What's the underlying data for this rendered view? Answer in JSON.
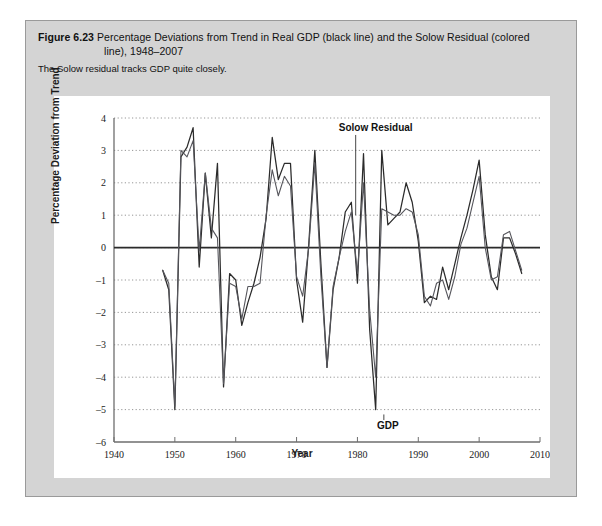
{
  "figure": {
    "label": "Figure 6.23",
    "title_line1": "Percentage Deviations from Trend in Real GDP (black line) and the Solow Residual (colored",
    "title_line2": "line), 1948–2007",
    "subtitle": "The Solow residual tracks GDP quite closely."
  },
  "colors": {
    "panel_background": "#d4d4d4",
    "panel_border": "#9a9a9a",
    "chart_background": "#ffffff",
    "gdp_line": "#2b2b2b",
    "solow_line": "#56565c",
    "grid": "#8a8a8a",
    "axis": "#6e6e6e",
    "zero_line": "#2b2b2b"
  },
  "chart_data": {
    "type": "line",
    "title": "Percentage Deviations from Trend in Real GDP (black line) and the Solow Residual (colored line), 1948–2007",
    "xlabel": "Year",
    "ylabel": "Percentage Deviation from Trend",
    "xlim": [
      1940,
      2010
    ],
    "ylim": [
      -6,
      4
    ],
    "xticks": [
      1940,
      1950,
      1960,
      1970,
      1980,
      1990,
      2000,
      2010
    ],
    "yticks": [
      -6,
      -5,
      -4,
      -3,
      -2,
      -1,
      0,
      1,
      2,
      3,
      4
    ],
    "grid": true,
    "legend_position": "inline-annotations",
    "annotations": [
      {
        "label": "Solow Residual",
        "x": 1983,
        "y": 3.6
      },
      {
        "label": "GDP",
        "x": 1985,
        "y": -5.6
      }
    ],
    "x": [
      1948,
      1949,
      1950,
      1951,
      1952,
      1953,
      1954,
      1955,
      1956,
      1957,
      1958,
      1959,
      1960,
      1961,
      1962,
      1963,
      1964,
      1965,
      1966,
      1967,
      1968,
      1969,
      1970,
      1971,
      1972,
      1973,
      1974,
      1975,
      1976,
      1977,
      1978,
      1979,
      1980,
      1981,
      1982,
      1983,
      1984,
      1985,
      1986,
      1987,
      1988,
      1989,
      1990,
      1991,
      1992,
      1993,
      1994,
      1995,
      1996,
      1997,
      1998,
      1999,
      2000,
      2001,
      2002,
      2003,
      2004,
      2005,
      2006,
      2007
    ],
    "series": [
      {
        "name": "GDP",
        "color": "#2b2b2b",
        "values": [
          -0.7,
          -1.3,
          -5.0,
          2.8,
          3.1,
          3.7,
          -0.6,
          2.3,
          0.3,
          2.6,
          -4.3,
          -0.8,
          -1.0,
          -2.4,
          -1.7,
          -1.1,
          -0.3,
          0.9,
          3.4,
          2.1,
          2.6,
          2.6,
          -1.0,
          -2.3,
          0.1,
          3.0,
          -0.5,
          -3.7,
          -1.3,
          -0.3,
          1.1,
          1.4,
          -1.1,
          2.9,
          -2.5,
          -5.0,
          3.0,
          0.7,
          0.9,
          1.1,
          2.0,
          1.4,
          0.2,
          -1.7,
          -1.5,
          -1.6,
          -0.6,
          -1.3,
          -0.5,
          0.3,
          1.0,
          1.8,
          2.7,
          0.4,
          -0.9,
          -1.3,
          0.3,
          0.3,
          -0.2,
          -0.8
        ]
      },
      {
        "name": "Solow Residual",
        "color": "#56565c",
        "values": [
          -0.7,
          -1.1,
          -4.9,
          3.0,
          2.8,
          3.3,
          -0.1,
          2.3,
          0.6,
          0.3,
          -4.2,
          -1.1,
          -1.2,
          -2.2,
          -1.2,
          -1.2,
          -1.1,
          1.0,
          2.4,
          1.6,
          2.2,
          1.9,
          -0.9,
          -1.5,
          0.0,
          2.6,
          -0.9,
          -3.7,
          -1.2,
          -0.3,
          0.5,
          1.1,
          -0.8,
          2.0,
          -1.9,
          -4.0,
          1.2,
          1.1,
          1.0,
          1.0,
          1.2,
          1.1,
          0.4,
          -1.5,
          -1.8,
          -1.1,
          -1.0,
          -1.6,
          -0.9,
          0.1,
          0.6,
          1.4,
          2.2,
          0.0,
          -1.0,
          -0.9,
          0.4,
          0.5,
          -0.1,
          -0.7
        ]
      }
    ]
  }
}
